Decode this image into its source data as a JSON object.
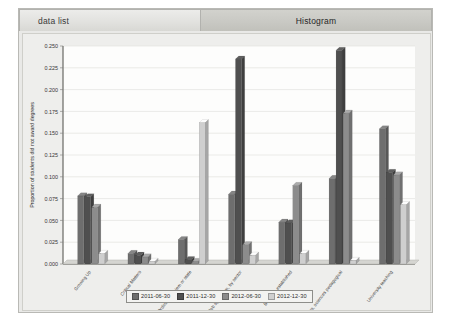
{
  "window": {
    "tabs": [
      {
        "label": "data list",
        "active": false
      },
      {
        "label": "Histogram",
        "active": true
      }
    ]
  },
  "chart_data": {
    "type": "bar",
    "title": "",
    "xlabel": "Student type",
    "ylabel": "Proportion of students did not award degrees",
    "ylim": [
      0,
      0.25
    ],
    "ytick_labels": [
      "0.250",
      "0.225",
      "0.200",
      "0.175",
      "0.150",
      "0.125",
      "0.100",
      "0.075",
      "0.050",
      "0.025",
      "0.000"
    ],
    "ytick_values": [
      0.25,
      0.225,
      0.2,
      0.175,
      0.15,
      0.125,
      0.1,
      0.075,
      0.05,
      0.025,
      0.0
    ],
    "grid": true,
    "legend_position": "bottom",
    "categories": [
      "Growing Up",
      "Critical Matters",
      "Ordinary problem or state",
      "Job specialism, by sector",
      "Business established",
      "Maths, sciences pedagogical",
      "University teaching"
    ],
    "series": [
      {
        "name": "2011-06-30",
        "color": "#6e6e6e",
        "values": [
          0.078,
          0.012,
          0.028,
          0.08,
          0.048,
          0.098,
          0.155
        ]
      },
      {
        "name": "2011-12-30",
        "color": "#4f4f4f",
        "values": [
          0.077,
          0.01,
          0.005,
          0.235,
          0.047,
          0.245,
          0.105
        ]
      },
      {
        "name": "2012-06-30",
        "color": "#8c8c8c",
        "values": [
          0.065,
          0.008,
          0.003,
          0.022,
          0.09,
          0.173,
          0.102
        ]
      },
      {
        "name": "2012-12-30",
        "color": "#cfcfcf",
        "values": [
          0.012,
          0.003,
          0.162,
          0.01,
          0.012,
          0.004,
          0.068
        ]
      }
    ]
  }
}
